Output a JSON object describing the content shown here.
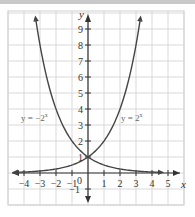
{
  "chart_data": {
    "type": "line",
    "title": "",
    "xlabel": "x",
    "ylabel": "y",
    "xlim": [
      -4.5,
      5.5
    ],
    "ylim": [
      -1.5,
      10
    ],
    "grid": true,
    "x_ticks": [
      "-4",
      "-3",
      "-2",
      "-1",
      "1",
      "2",
      "3",
      "4",
      "5"
    ],
    "y_ticks": [
      "-1",
      "1",
      "2",
      "3",
      "4",
      "5",
      "6",
      "7",
      "8",
      "9"
    ],
    "origin_label": "0",
    "series": [
      {
        "name": "y = 2^x",
        "label": "y = 2",
        "label_exp": "x",
        "x": [
          -4.7,
          -4,
          -3,
          -2,
          -1,
          0,
          1,
          2,
          3,
          3.3
        ],
        "values": [
          0.04,
          0.0625,
          0.125,
          0.25,
          0.5,
          1,
          2,
          4,
          8,
          9.85
        ]
      },
      {
        "name": "y = -2^x",
        "label": "y = −2",
        "label_exp": "x",
        "x": [
          -3.3,
          -3,
          -2,
          -1,
          0,
          1,
          2,
          3,
          4,
          4.7
        ],
        "values": [
          9.85,
          8,
          4,
          2,
          1,
          0.5,
          0.25,
          0.125,
          0.0625,
          0.04
        ]
      }
    ],
    "legend": "none; curves labeled inline"
  },
  "labels": {
    "x_axis": "x",
    "y_axis": "y",
    "origin": "0",
    "curve_left": "y = −2",
    "curve_left_exp": "x",
    "curve_right": "y = 2",
    "curve_right_exp": "x"
  }
}
